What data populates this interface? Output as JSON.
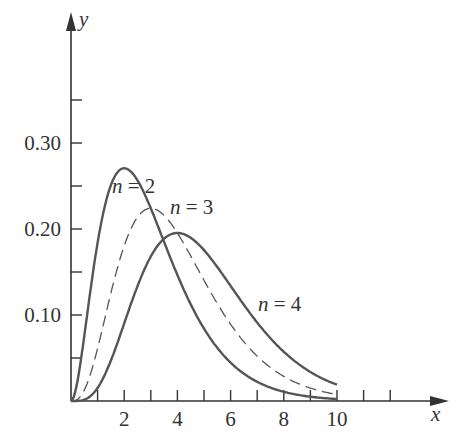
{
  "chart_data": {
    "type": "line",
    "title": "",
    "xlabel": "x",
    "ylabel": "y",
    "xlim": [
      0,
      14.3
    ],
    "ylim": [
      0,
      0.47
    ],
    "x_ticks": [
      1,
      2,
      3,
      4,
      5,
      6,
      7,
      8,
      9,
      10,
      11,
      12
    ],
    "x_tick_labels": [
      {
        "v": 2,
        "t": "2"
      },
      {
        "v": 4,
        "t": "4"
      },
      {
        "v": 6,
        "t": "6"
      },
      {
        "v": 8,
        "t": "8"
      },
      {
        "v": 10,
        "t": "10"
      }
    ],
    "y_ticks": [
      0.05,
      0.1,
      0.15,
      0.2,
      0.25,
      0.3,
      0.35
    ],
    "y_tick_labels": [
      {
        "v": 0.1,
        "t": "0.10"
      },
      {
        "v": 0.2,
        "t": "0.20"
      },
      {
        "v": 0.3,
        "t": "0.30"
      }
    ],
    "grid": false,
    "legend": "inline annotations",
    "series": [
      {
        "name": "n = 2",
        "style": "solid",
        "x": [
          0,
          1,
          2,
          3,
          4,
          5,
          6,
          7,
          8,
          9,
          10
        ],
        "values": [
          0,
          0.184,
          0.271,
          0.224,
          0.147,
          0.084,
          0.045,
          0.022,
          0.011,
          0.005,
          0.002
        ]
      },
      {
        "name": "n = 3",
        "style": "dashed",
        "x": [
          0,
          1,
          2,
          3,
          4,
          5,
          6,
          7,
          8,
          9,
          10
        ],
        "values": [
          0,
          0.061,
          0.18,
          0.224,
          0.195,
          0.14,
          0.089,
          0.052,
          0.029,
          0.015,
          0.008
        ]
      },
      {
        "name": "n = 4",
        "style": "solid",
        "x": [
          0,
          1,
          2,
          3,
          4,
          5,
          6,
          7,
          8,
          9,
          10
        ],
        "values": [
          0,
          0.015,
          0.09,
          0.168,
          0.195,
          0.175,
          0.134,
          0.091,
          0.057,
          0.034,
          0.019
        ]
      }
    ],
    "annotations": [
      {
        "text": "n = 2",
        "x": 2.2,
        "y": 0.29
      },
      {
        "text": "n = 3",
        "x": 3.8,
        "y": 0.235
      },
      {
        "text": "n = 4",
        "x": 7.0,
        "y": 0.11
      }
    ]
  }
}
